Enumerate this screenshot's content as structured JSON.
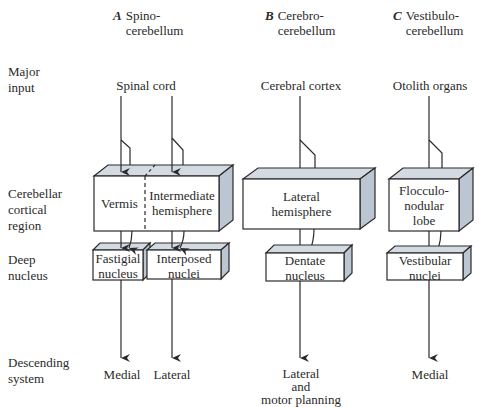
{
  "columns": [
    {
      "letter": "A",
      "title_line1": "Spino-",
      "title_line2": "cerebellum",
      "input": "Spinal cord",
      "cortical": [
        {
          "line1": "Vermis",
          "line2": ""
        },
        {
          "line1": "Intermediate",
          "line2": "hemisphere"
        }
      ],
      "nuclei": [
        {
          "line1": "Fastigial",
          "line2": "nucleus"
        },
        {
          "line1": "Interposed",
          "line2": "nuclei"
        }
      ],
      "output": [
        {
          "line1": "Medial"
        },
        {
          "line1": "Lateral"
        }
      ]
    },
    {
      "letter": "B",
      "title_line1": "Cerebro-",
      "title_line2": "cerebellum",
      "input": "Cerebral cortex",
      "cortical": [
        {
          "line1": "Lateral",
          "line2": "hemisphere"
        }
      ],
      "nuclei": [
        {
          "line1": "Dentate",
          "line2": "nucleus"
        }
      ],
      "output": [
        {
          "line1": "Lateral",
          "line2": "and",
          "line3": "motor planning"
        }
      ]
    },
    {
      "letter": "C",
      "title_line1": "Vestibulo-",
      "title_line2": "cerebellum",
      "input": "Otolith organs",
      "cortical": [
        {
          "line1": "Flocculo-",
          "line2": "nodular",
          "line3": "lobe"
        }
      ],
      "nuclei": [
        {
          "line1": "Vestibular",
          "line2": "nuclei"
        }
      ],
      "output": [
        {
          "line1": "Medial"
        }
      ]
    }
  ],
  "row_labels": {
    "input": {
      "line1": "Major",
      "line2": "input"
    },
    "cortical": {
      "line1": "Cerebellar",
      "line2": "cortical",
      "line3": "region"
    },
    "nucleus": {
      "line1": "Deep",
      "line2": "nucleus"
    },
    "descending": {
      "line1": "Descending",
      "line2": "system"
    }
  },
  "colors": {
    "box_front": "#ffffff",
    "box_top": "#d4dae2",
    "box_side": "#bcc6d2",
    "stroke": "#2a2a2a"
  }
}
